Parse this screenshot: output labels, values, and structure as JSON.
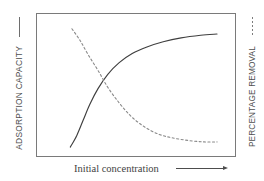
{
  "figure": {
    "background_color": "#ffffff",
    "frame_color": "#7a7a7a"
  },
  "left_axis": {
    "label": "ADSORPTION CAPACITY",
    "legend_mark": "solid-line-mark",
    "series_style": "solid"
  },
  "right_axis": {
    "label": "PERCENTAGE REMOVAL",
    "legend_mark": "dashed-line-mark",
    "series_style": "dashed"
  },
  "x_axis": {
    "label": "Initial concentration",
    "arrow": "right-arrow"
  },
  "chart_data": {
    "type": "line",
    "title": "",
    "xlabel": "Initial concentration",
    "ylabel": "ADSORPTION CAPACITY",
    "y2label": "PERCENTAGE REMOVAL",
    "xlim": [
      0,
      1
    ],
    "ylim": [
      0,
      1
    ],
    "grid": false,
    "legend": "none",
    "axis_ticks": "none",
    "series": [
      {
        "name": "ADSORPTION CAPACITY",
        "style": "solid",
        "color": "#3f3f3f",
        "axis": "left",
        "description": "Rising saturation curve that increases steeply then plateaus",
        "x": [
          0.1,
          0.14,
          0.18,
          0.22,
          0.27,
          0.33,
          0.4,
          0.48,
          0.57,
          0.67,
          0.78,
          0.9,
          1.0
        ],
        "y": [
          0.03,
          0.12,
          0.24,
          0.36,
          0.48,
          0.59,
          0.68,
          0.75,
          0.8,
          0.84,
          0.87,
          0.89,
          0.9
        ]
      },
      {
        "name": "PERCENTAGE REMOVAL",
        "style": "dashed",
        "color": "#8a8a8a",
        "axis": "right",
        "description": "Decaying curve that falls steeply then levels off near the baseline",
        "x": [
          0.11,
          0.16,
          0.21,
          0.27,
          0.33,
          0.4,
          0.47,
          0.55,
          0.64,
          0.73,
          0.83,
          0.92,
          1.0
        ],
        "y": [
          0.94,
          0.85,
          0.74,
          0.62,
          0.49,
          0.37,
          0.27,
          0.19,
          0.13,
          0.1,
          0.08,
          0.07,
          0.07
        ]
      }
    ],
    "intersection": {
      "x": 0.27,
      "y": 0.5
    }
  }
}
